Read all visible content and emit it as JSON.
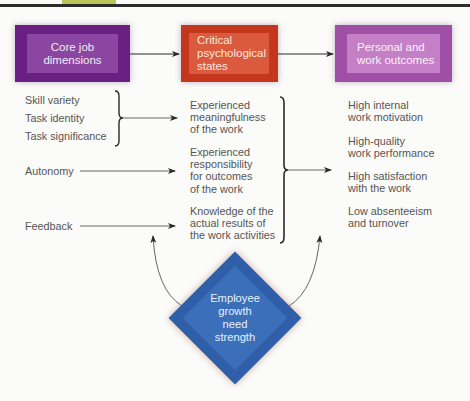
{
  "header": {
    "accent_tab_color": "#b9c45a",
    "rule_color": "#2d2d2d"
  },
  "boxes": {
    "core": {
      "lines": [
        "Core job",
        "dimensions"
      ],
      "color": "#6a1f83"
    },
    "critical": {
      "lines": [
        "Critical",
        "psychological",
        "states"
      ],
      "color": "#c5371d"
    },
    "outcomes": {
      "lines": [
        "Personal and",
        "work outcomes"
      ],
      "color": "#a04fa6"
    }
  },
  "core_dimensions": {
    "group1": [
      "Skill variety",
      "Task identity",
      "Task significance"
    ],
    "autonomy": "Autonomy",
    "feedback": "Feedback"
  },
  "psychological_states": [
    {
      "lines": [
        "Experienced",
        "meaningfulness",
        "of the work"
      ]
    },
    {
      "lines": [
        "Experienced",
        "responsibility",
        "for outcomes",
        "of the work"
      ]
    },
    {
      "lines": [
        "Knowledge of the",
        "actual results of",
        "the work activities"
      ]
    }
  ],
  "outcomes": [
    {
      "lines": [
        "High internal",
        "work motivation"
      ]
    },
    {
      "lines": [
        "High-quality",
        "work performance"
      ]
    },
    {
      "lines": [
        "High satisfaction",
        "with the work"
      ]
    },
    {
      "lines": [
        "Low absenteeism",
        "and turnover"
      ]
    }
  ],
  "moderator": {
    "lines": [
      "Employee",
      "growth",
      "need",
      "strength"
    ],
    "color": "#2f5fa8"
  }
}
